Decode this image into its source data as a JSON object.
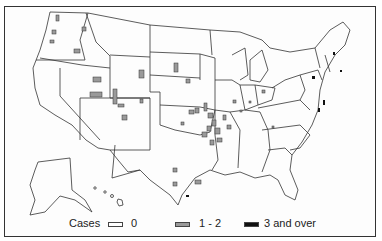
{
  "map": {
    "type": "choropleth",
    "region": "United States (counties), incl. Alaska and Hawaii insets",
    "colors": {
      "border": "#333333",
      "zero": "#ffffff",
      "low": "#9a9a9a",
      "high": "#111111"
    }
  },
  "legend": {
    "title": "Cases",
    "items": [
      {
        "label": "0",
        "fill": "#ffffff"
      },
      {
        "label": "1 - 2",
        "fill": "#9a9a9a"
      },
      {
        "label": "3 and over",
        "fill": "#111111"
      }
    ]
  }
}
